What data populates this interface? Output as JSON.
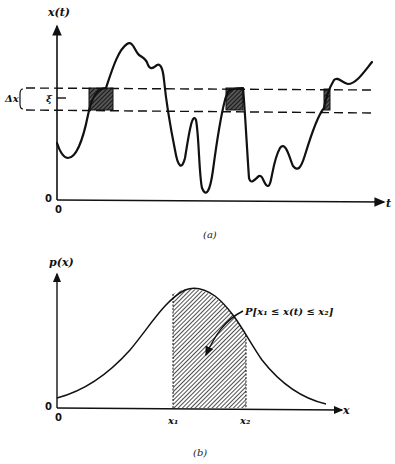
{
  "figure_a": {
    "caption": "(a)",
    "y_axis_label": "x(t)",
    "x_axis_label": "t",
    "origin_x_label": "0",
    "origin_y_label": "0",
    "band_label": "Δx",
    "level_label": "ξ"
  },
  "figure_b": {
    "caption": "(b)",
    "y_axis_label": "p(x)",
    "x_axis_label": "x",
    "origin_x_label": "0",
    "origin_y_label": "0",
    "x1_label": "x₁",
    "x2_label": "x₂",
    "annotation": "P[x₁ ≤ x(t) ≤ x₂]"
  },
  "colors": {
    "ink": "#111111",
    "background": "#ffffff"
  }
}
